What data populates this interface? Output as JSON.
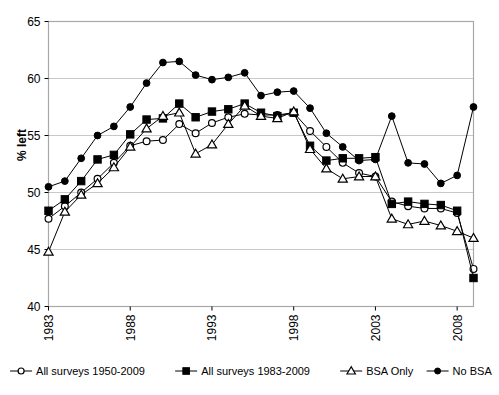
{
  "chart_data": {
    "type": "line",
    "title": "",
    "xlabel": "",
    "ylabel": "% left",
    "ylim": [
      40,
      65
    ],
    "ytick_values": [
      40,
      45,
      50,
      55,
      60,
      65
    ],
    "xlim": [
      1983,
      2009
    ],
    "xtick_values": [
      1983,
      1988,
      1993,
      1998,
      2003,
      2008
    ],
    "grid": "horizontal",
    "legend_position": "bottom",
    "x": [
      1983,
      1984,
      1985,
      1986,
      1987,
      1988,
      1989,
      1990,
      1991,
      1992,
      1993,
      1994,
      1995,
      1996,
      1997,
      1998,
      1999,
      2000,
      2001,
      2002,
      2003,
      2004,
      2005,
      2006,
      2007,
      2008,
      2009
    ],
    "series": [
      {
        "name": "All surveys 1950-2009",
        "marker": "open-circle",
        "values": [
          47.7,
          48.8,
          50.0,
          51.2,
          52.6,
          54.1,
          54.5,
          54.6,
          56.0,
          55.2,
          56.1,
          56.6,
          56.9,
          56.8,
          56.8,
          57.0,
          55.4,
          54.0,
          52.6,
          51.7,
          51.4,
          49.2,
          48.8,
          48.6,
          48.6,
          48.2,
          43.3
        ]
      },
      {
        "name": "All surveys 1983-2009",
        "marker": "filled-square",
        "values": [
          48.4,
          49.4,
          51.0,
          52.9,
          53.3,
          55.1,
          56.4,
          56.5,
          57.8,
          56.6,
          57.1,
          57.3,
          57.8,
          57.0,
          56.7,
          57.0,
          54.1,
          52.8,
          53.0,
          53.0,
          53.1,
          49.0,
          49.2,
          49.0,
          48.9,
          48.4,
          42.5
        ]
      },
      {
        "name": "BSA Only",
        "marker": "open-triangle",
        "values": [
          44.8,
          48.3,
          49.8,
          50.8,
          52.2,
          54.0,
          55.6,
          56.7,
          57.0,
          53.4,
          54.2,
          56.0,
          57.6,
          56.7,
          56.5,
          57.1,
          53.8,
          52.1,
          51.2,
          51.4,
          51.4,
          47.7,
          47.2,
          47.5,
          47.1,
          46.6,
          46.0
        ]
      },
      {
        "name": "No BSA",
        "marker": "filled-circle",
        "values": [
          50.5,
          51.0,
          53.0,
          55.0,
          55.8,
          57.5,
          59.6,
          61.4,
          61.5,
          60.3,
          59.9,
          60.1,
          60.5,
          58.5,
          58.8,
          58.9,
          57.4,
          55.2,
          54.0,
          52.8,
          52.9,
          56.7,
          52.6,
          52.5,
          50.8,
          51.5,
          57.5
        ]
      }
    ]
  },
  "axis": {
    "y_title": "% left",
    "y_ticks": [
      "65",
      "60",
      "55",
      "50",
      "45",
      "40"
    ],
    "x_ticks": [
      "1983",
      "1988",
      "1993",
      "1998",
      "2003",
      "2008"
    ]
  },
  "legend": {
    "items": [
      {
        "label": "All surveys 1950-2009",
        "marker": "open-circle"
      },
      {
        "label": "All surveys 1983-2009",
        "marker": "filled-square"
      },
      {
        "label": "BSA Only",
        "marker": "open-triangle"
      },
      {
        "label": "No BSA",
        "marker": "filled-circle"
      }
    ]
  },
  "colors": {
    "line": "#000000",
    "grid": "#c8c8c8",
    "frame": "#a8a8a8",
    "background": "#ffffff"
  }
}
